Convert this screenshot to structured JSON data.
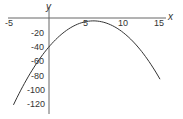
{
  "chart_data": {
    "type": "line",
    "title": "",
    "xlabel": "x",
    "ylabel": "y",
    "xlim": [
      -5,
      16
    ],
    "ylim": [
      -130,
      5
    ],
    "grid": false,
    "x_ticks": [
      -5,
      5,
      10,
      15
    ],
    "x_tick_labels": [
      "-5",
      "5",
      "10",
      "15"
    ],
    "y_ticks": [
      -20,
      -40,
      -60,
      -80,
      -100,
      -120
    ],
    "y_tick_labels": [
      "-20",
      "-40",
      "-60",
      "-80",
      "-100",
      "-120"
    ],
    "series": [
      {
        "name": "y = -x^2 + 12x - 40",
        "x": [
          -4.8,
          -4,
          -2,
          0,
          2,
          4,
          6,
          8,
          10,
          12,
          14,
          15
        ],
        "y": [
          -120.6,
          -104,
          -68,
          -40,
          -20,
          -8,
          -4,
          -8,
          -20,
          -40,
          -68,
          -85
        ],
        "color": "#333333"
      }
    ]
  }
}
